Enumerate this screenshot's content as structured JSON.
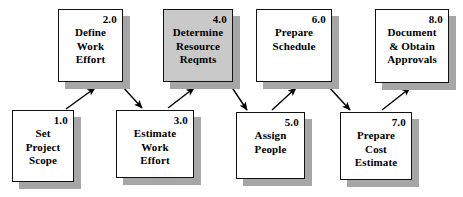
{
  "diagram": {
    "type": "flowchart",
    "background_color": "#ffffff",
    "box_fill_default": "#ffffff",
    "box_fill_highlight": "#c9c9c9",
    "box_border_color": "#121212",
    "shadow_color": "#a6a6a6",
    "arrow_color": "#000000"
  },
  "nodes": [
    {
      "key": "set-project-scope",
      "id": "1.0",
      "lines": [
        "Set",
        "Project",
        "Scope"
      ],
      "filled": false,
      "row": "bottom",
      "x": 12,
      "y": 110,
      "w": 62,
      "h": 72
    },
    {
      "key": "define-work-effort",
      "id": "2.0",
      "lines": [
        "Define",
        "Work",
        "Effort"
      ],
      "filled": false,
      "row": "top",
      "x": 58,
      "y": 9,
      "w": 65,
      "h": 73
    },
    {
      "key": "estimate-work-effort",
      "id": "3.0",
      "lines": [
        "Estimate",
        "Work",
        "Effort"
      ],
      "filled": false,
      "row": "bottom",
      "x": 116,
      "y": 110,
      "w": 78,
      "h": 68
    },
    {
      "key": "determine-resource-reqmts",
      "id": "4.0",
      "lines": [
        "Determine",
        "Resource",
        "Reqmts"
      ],
      "filled": true,
      "row": "top",
      "x": 163,
      "y": 9,
      "w": 70,
      "h": 73
    },
    {
      "key": "assign-people",
      "id": "5.0",
      "lines": [
        "Assign",
        "People"
      ],
      "filled": false,
      "row": "bottom",
      "x": 236,
      "y": 112,
      "w": 69,
      "h": 67
    },
    {
      "key": "prepare-schedule",
      "id": "6.0",
      "lines": [
        "Prepare",
        "Schedule"
      ],
      "filled": false,
      "row": "top",
      "x": 256,
      "y": 9,
      "w": 76,
      "h": 73
    },
    {
      "key": "prepare-cost-estimate",
      "id": "7.0",
      "lines": [
        "Prepare",
        "Cost",
        "Estimate"
      ],
      "filled": false,
      "row": "bottom",
      "x": 340,
      "y": 112,
      "w": 72,
      "h": 68
    },
    {
      "key": "document-obtain-approvals",
      "id": "8.0",
      "lines": [
        "Document",
        "& Obtain",
        "Approvals"
      ],
      "filled": false,
      "row": "top",
      "x": 375,
      "y": 9,
      "w": 74,
      "h": 74
    }
  ],
  "edges": [
    {
      "key": "edge-1-to-2",
      "from": "1.0",
      "to": "2.0",
      "x1": 66,
      "y1": 109,
      "x2": 95,
      "y2": 88
    },
    {
      "key": "edge-2-to-3",
      "from": "2.0",
      "to": "3.0",
      "x1": 122,
      "y1": 86,
      "x2": 142,
      "y2": 108
    },
    {
      "key": "edge-3-to-4",
      "from": "3.0",
      "to": "4.0",
      "x1": 168,
      "y1": 108,
      "x2": 194,
      "y2": 88
    },
    {
      "key": "edge-4-to-5",
      "from": "4.0",
      "to": "5.0",
      "x1": 231,
      "y1": 86,
      "x2": 247,
      "y2": 110
    },
    {
      "key": "edge-5-to-6",
      "from": "5.0",
      "to": "6.0",
      "x1": 272,
      "y1": 110,
      "x2": 296,
      "y2": 88
    },
    {
      "key": "edge-6-to-7",
      "from": "6.0",
      "to": "7.0",
      "x1": 328,
      "y1": 86,
      "x2": 350,
      "y2": 110
    },
    {
      "key": "edge-7-to-8",
      "from": "7.0",
      "to": "8.0",
      "x1": 382,
      "y1": 110,
      "x2": 410,
      "y2": 88
    }
  ]
}
